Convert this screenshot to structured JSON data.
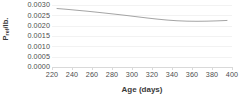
{
  "chart_data": {
    "type": "line",
    "title": "",
    "xlabel": "Age (days)",
    "ylabel": "Pref/lb.",
    "ylabel_base": "P",
    "ylabel_sub": "ref",
    "ylabel_tail": "/lb.",
    "xlim": [
      220,
      400
    ],
    "ylim": [
      0.0,
      0.003
    ],
    "grid": true,
    "legend": false,
    "legend_position": "none",
    "x_tick_labels": [
      "220",
      "240",
      "260",
      "280",
      "300",
      "320",
      "340",
      "360",
      "380",
      "400"
    ],
    "x_ticks": [
      220,
      240,
      260,
      280,
      300,
      320,
      340,
      360,
      380,
      400
    ],
    "y_tick_labels": [
      "0.0030",
      "0.0025",
      "0.0020",
      "0.0015",
      "0.0010",
      "0.0005",
      "0.0000"
    ],
    "y_ticks": [
      0.003,
      0.0025,
      0.002,
      0.0015,
      0.001,
      0.0005,
      0.0
    ],
    "series": [
      {
        "name": "Pref/lb.",
        "color": "#9a9a9a",
        "x": [
          225,
          235,
          245,
          255,
          265,
          275,
          285,
          295,
          305,
          315,
          325,
          335,
          345,
          355,
          365,
          375,
          385,
          395
        ],
        "values": [
          0.00283,
          0.00279,
          0.002745,
          0.0027,
          0.00265,
          0.002598,
          0.002545,
          0.00249,
          0.00243,
          0.002372,
          0.002318,
          0.002272,
          0.002238,
          0.002218,
          0.002212,
          0.002218,
          0.002232,
          0.002252
        ]
      }
    ]
  },
  "style": {
    "line_color": "#9a9a9a",
    "gridline_color": "#f2f2f2",
    "axis_color": "#d9d9d9",
    "text_color": "#4d4d4d",
    "title_color": "#3a3a3a",
    "background": "#ffffff"
  }
}
